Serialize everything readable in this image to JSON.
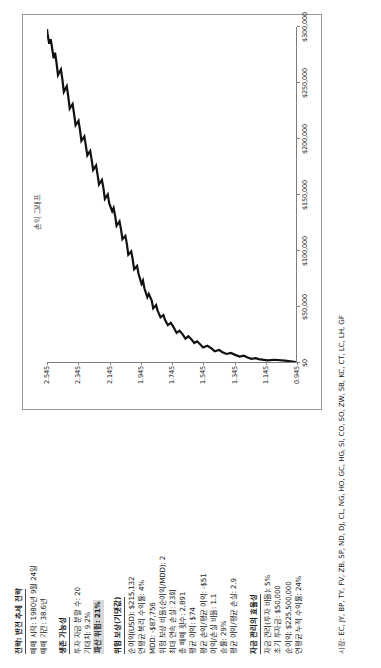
{
  "report": {
    "title": "전략: 반전 추세 전략",
    "start_label": "매매 시작: 1980년 9월 24일",
    "duration_label": "매매 기간: 38.6년",
    "markets_label": "시장: EC, JY, BP, TY, FV, ZB, SP, ND, DJ, CL, NG, HO, GC, HG, SI, CO, SO, ZW, SB, KC, CT, LC, LH, GF"
  },
  "survivability": {
    "heading": "생존 가능성",
    "items": [
      "투자 자금 분할 수: 20",
      "기대치: 9.2%"
    ],
    "highlight": "파산 위험: 21%"
  },
  "risk_reward": {
    "heading": "위험 보상(기댓값)",
    "items": [
      "순이익(USD): $215,132",
      "연평균 복리 수익률: 4%",
      "MDD: -$87,756",
      "위험 보상 비율(순이익/MDD): 2",
      "최대 연속 손실: 23회",
      "총 매매 횟수: 2,891",
      "평균 이익: $74",
      "평균 손익/평균 이익: -$51",
      "이익/손실 비율: 1.1",
      "승률: 29%",
      "평균 이익/평균 손실: 2.9"
    ]
  },
  "money_management": {
    "heading": "자금 관리의 효율성",
    "items": [
      "자금 관리(투자 비율): 5%",
      "초기 투자금: $50,000",
      "순이익: $225,500,000",
      "연평균 누적 수익률: 24%"
    ]
  },
  "chart_data": {
    "type": "line",
    "title": "손익 그래프",
    "xlabel": "",
    "ylabel": "",
    "yticks": [
      "0.945",
      "1.145",
      "1.345",
      "1.545",
      "1.745",
      "1.945",
      "2.145",
      "2.345",
      "2.545"
    ],
    "xticks": [
      "$0",
      "$50,000",
      "$100,000",
      "$150,000",
      "$200,000",
      "$250,000",
      "$300,000"
    ],
    "xlim": [
      0,
      300000
    ],
    "ylim": [
      0.945,
      2.645
    ],
    "grid": false,
    "legend": "none",
    "series": [
      {
        "name": "누적 손익",
        "points": [
          [
            0,
            0.945
          ],
          [
            1200,
            1.02
          ],
          [
            2000,
            1.09
          ],
          [
            1500,
            1.14
          ],
          [
            2600,
            1.2
          ],
          [
            3400,
            1.22
          ],
          [
            2800,
            1.25
          ],
          [
            4200,
            1.28
          ],
          [
            5600,
            1.3
          ],
          [
            4800,
            1.33
          ],
          [
            6400,
            1.36
          ],
          [
            8100,
            1.39
          ],
          [
            7200,
            1.42
          ],
          [
            9000,
            1.45
          ],
          [
            10800,
            1.47
          ],
          [
            9600,
            1.5
          ],
          [
            12000,
            1.52
          ],
          [
            14500,
            1.55
          ],
          [
            13000,
            1.58
          ],
          [
            16000,
            1.6
          ],
          [
            18500,
            1.62
          ],
          [
            17000,
            1.64
          ],
          [
            20500,
            1.66
          ],
          [
            23000,
            1.68
          ],
          [
            21000,
            1.7
          ],
          [
            25000,
            1.72
          ],
          [
            28000,
            1.74
          ],
          [
            26000,
            1.76
          ],
          [
            31000,
            1.78
          ],
          [
            35000,
            1.8
          ],
          [
            33000,
            1.82
          ],
          [
            38000,
            1.84
          ],
          [
            42000,
            1.85
          ],
          [
            40000,
            1.87
          ],
          [
            46000,
            1.89
          ],
          [
            51000,
            1.9
          ],
          [
            48000,
            1.92
          ],
          [
            55000,
            1.93
          ],
          [
            61000,
            1.95
          ],
          [
            58000,
            1.96
          ],
          [
            66000,
            1.98
          ],
          [
            73000,
            1.99
          ],
          [
            70000,
            2.0
          ],
          [
            79000,
            2.02
          ],
          [
            86000,
            2.03
          ],
          [
            83000,
            2.05
          ],
          [
            92000,
            2.06
          ],
          [
            99000,
            2.07
          ],
          [
            96000,
            2.09
          ],
          [
            106000,
            2.1
          ],
          [
            113000,
            2.11
          ],
          [
            110000,
            2.13
          ],
          [
            119000,
            2.14
          ],
          [
            126000,
            2.15
          ],
          [
            122000,
            2.17
          ],
          [
            131000,
            2.18
          ],
          [
            138000,
            2.19
          ],
          [
            135000,
            2.2
          ],
          [
            142000,
            2.22
          ],
          [
            150000,
            2.23
          ],
          [
            146000,
            2.25
          ],
          [
            156000,
            2.26
          ],
          [
            163000,
            2.27
          ],
          [
            159000,
            2.29
          ],
          [
            168000,
            2.3
          ],
          [
            176000,
            2.31
          ],
          [
            172000,
            2.33
          ],
          [
            181000,
            2.34
          ],
          [
            189000,
            2.35
          ],
          [
            185000,
            2.37
          ],
          [
            194000,
            2.38
          ],
          [
            202000,
            2.39
          ],
          [
            198000,
            2.41
          ],
          [
            208000,
            2.42
          ],
          [
            216000,
            2.43
          ],
          [
            212000,
            2.45
          ],
          [
            222000,
            2.46
          ],
          [
            231000,
            2.47
          ],
          [
            227000,
            2.49
          ],
          [
            238000,
            2.5
          ],
          [
            247000,
            2.51
          ],
          [
            242000,
            2.53
          ],
          [
            253000,
            2.54
          ],
          [
            262000,
            2.55
          ],
          [
            257000,
            2.57
          ],
          [
            268000,
            2.58
          ],
          [
            277000,
            2.59
          ],
          [
            272000,
            2.6
          ],
          [
            281000,
            2.61
          ],
          [
            289000,
            2.62
          ],
          [
            285000,
            2.63
          ],
          [
            293000,
            2.64
          ],
          [
            298000,
            2.645
          ]
        ]
      }
    ]
  }
}
